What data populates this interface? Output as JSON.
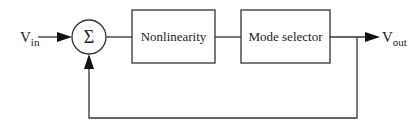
{
  "diagram": {
    "type": "block-diagram",
    "input": {
      "label": "V",
      "subscript": "in"
    },
    "output": {
      "label": "V",
      "subscript": "out"
    },
    "summing_junction": {
      "symbol": "Σ"
    },
    "blocks": [
      {
        "id": "nonlinearity",
        "label": "Nonlinearity"
      },
      {
        "id": "mode-selector",
        "label": "Mode selector"
      }
    ],
    "connections": [
      {
        "from": "input",
        "to": "summing_junction"
      },
      {
        "from": "summing_junction",
        "to": "nonlinearity"
      },
      {
        "from": "nonlinearity",
        "to": "mode-selector"
      },
      {
        "from": "mode-selector",
        "to": "output"
      },
      {
        "from": "output",
        "to": "summing_junction",
        "kind": "feedback"
      }
    ]
  }
}
